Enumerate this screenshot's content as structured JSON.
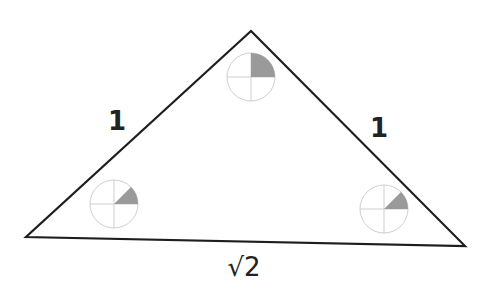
{
  "diagram": {
    "stroke_color": "#1e1e1e",
    "circle_color": "#cfcfcf",
    "shade_color": "#9a9a9a",
    "vertices": {
      "apex": {
        "x": 251,
        "y": 31
      },
      "left": {
        "x": 26,
        "y": 237
      },
      "right": {
        "x": 465,
        "y": 246
      }
    },
    "side_labels": {
      "left": "1",
      "right": "1",
      "base": "√2"
    },
    "angle_indicators": [
      {
        "name": "apex",
        "cx": 251,
        "cy": 77,
        "r": 24,
        "shaded_degrees": 90
      },
      {
        "name": "left",
        "cx": 114,
        "cy": 204,
        "r": 24,
        "shaded_degrees": 45
      },
      {
        "name": "right",
        "cx": 384,
        "cy": 209,
        "r": 24,
        "shaded_degrees": 45
      }
    ]
  }
}
